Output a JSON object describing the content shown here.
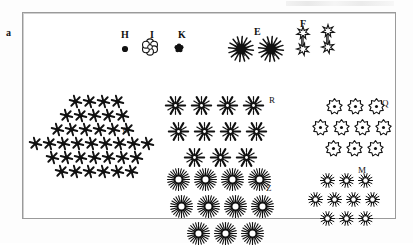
{
  "figure": {
    "panel_letter": "a",
    "legend": {
      "items": [
        {
          "label": "H",
          "glyph": "solid-dot-icon",
          "x": 121,
          "y": 30,
          "gx": 118,
          "gy": 42
        },
        {
          "label": "I",
          "glyph": "outline-flower-icon",
          "x": 150,
          "y": 30,
          "gx": 141,
          "gy": 38
        },
        {
          "label": "K",
          "glyph": "solid-clover-icon",
          "x": 178,
          "y": 30,
          "gx": 172,
          "gy": 41
        },
        {
          "label": "E",
          "glyph": "solid-starburst-icon",
          "x": 254,
          "y": 27,
          "gx": 228,
          "gy": 36
        },
        {
          "label": "F",
          "glyph": "outline-spiky-star-icon",
          "x": 300,
          "y": 19,
          "gx": 288,
          "gy": 26
        }
      ],
      "extra_glyphs": [
        {
          "glyph": "solid-starburst-icon",
          "gx": 258,
          "gy": 36
        },
        {
          "glyph": "outline-spiky-star-icon",
          "gx": 313,
          "gy": 24
        }
      ]
    },
    "clusters": [
      {
        "name": "O",
        "label_x": 123,
        "label_y": 126,
        "glyph": "six-point-asterisk-icon",
        "x": 28,
        "y": 94,
        "cell": 14,
        "size": 13,
        "rows": [
          {
            "count": 4,
            "indent": 1.6
          },
          {
            "count": 5,
            "indent": 1.1
          },
          {
            "count": 6,
            "indent": 0.5
          },
          {
            "count": 9,
            "indent": 0.0
          },
          {
            "count": 7,
            "indent": 0.9
          },
          {
            "count": 6,
            "indent": 1.5
          }
        ]
      },
      {
        "name": "R",
        "label_x": 269,
        "label_y": 96,
        "glyph": "snowflake-icon",
        "x": 160,
        "y": 92,
        "cell": 26,
        "size": 21,
        "rows": [
          {
            "count": 4,
            "indent": 0.0
          },
          {
            "count": 4,
            "indent": 0.4
          },
          {
            "count": 3,
            "indent": 0.9
          }
        ]
      },
      {
        "name": "Q",
        "label_x": 382,
        "label_y": 99,
        "glyph": "outline-blob-flower-icon",
        "x": 310,
        "y": 96,
        "cell": 21,
        "size": 17,
        "rows": [
          {
            "count": 3,
            "indent": 0.6
          },
          {
            "count": 4,
            "indent": 0.0
          },
          {
            "count": 3,
            "indent": 0.5
          }
        ]
      },
      {
        "name": "Z",
        "label_x": 266,
        "label_y": 184,
        "glyph": "sun-burst-icon",
        "x": 162,
        "y": 166,
        "cell": 27,
        "size": 23,
        "rows": [
          {
            "count": 4,
            "indent": 0.0
          },
          {
            "count": 4,
            "indent": 0.45
          },
          {
            "count": 3,
            "indent": 0.95
          }
        ]
      },
      {
        "name": "M",
        "label_x": 358,
        "label_y": 166,
        "glyph": "small-sun-burst-icon",
        "x": 306,
        "y": 171,
        "cell": 19,
        "size": 15,
        "rows": [
          {
            "count": 3,
            "indent": 0.6
          },
          {
            "count": 4,
            "indent": 0.0
          },
          {
            "count": 3,
            "indent": 0.5
          }
        ]
      }
    ]
  },
  "colors": {
    "ink": "#111111",
    "frame": "#9a9a9a",
    "background": "#ffffff"
  }
}
